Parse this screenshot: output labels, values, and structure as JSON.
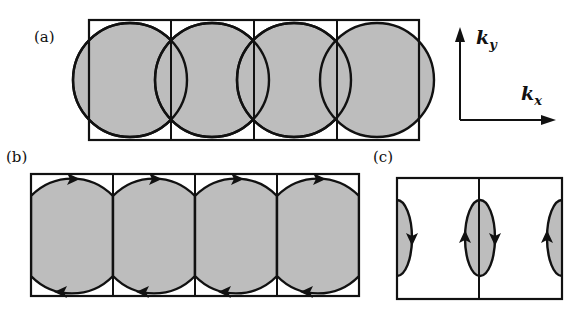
{
  "figure": {
    "panels": [
      {
        "id": "a",
        "label": "(a)",
        "description": "Four overlapping circular Fermi surfaces in a row of four square Brillouin zones"
      },
      {
        "id": "b",
        "label": "(b)",
        "description": "Circles truncated at zone boundaries forming closed orbits with arrows"
      },
      {
        "id": "c",
        "label": "(c)",
        "description": "Small lens-shaped pockets at zone boundaries with orbit arrows"
      }
    ],
    "axes": {
      "y_label": "k",
      "y_sub": "y",
      "x_label": "k",
      "x_sub": "x"
    },
    "colors": {
      "fill": "#bdbdbd",
      "stroke": "#111111",
      "background": "#ffffff"
    }
  }
}
